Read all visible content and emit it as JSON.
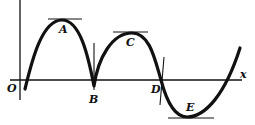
{
  "diagram": {
    "type": "function-graph",
    "colors": {
      "ink": "#111111",
      "background": "#ffffff"
    },
    "axes": {
      "origin_label": "O",
      "x_label": "x"
    },
    "points": [
      {
        "id": "A",
        "label": "A",
        "kind": "local maximum (horizontal tangent)"
      },
      {
        "id": "B",
        "label": "B",
        "kind": "cusp (vertical tangent)"
      },
      {
        "id": "C",
        "label": "C",
        "kind": "local maximum (horizontal tangent)"
      },
      {
        "id": "D",
        "label": "D",
        "kind": "x-intercept / inflection (steep tangent)"
      },
      {
        "id": "E",
        "label": "E",
        "kind": "local minimum (horizontal tangent)"
      }
    ]
  }
}
